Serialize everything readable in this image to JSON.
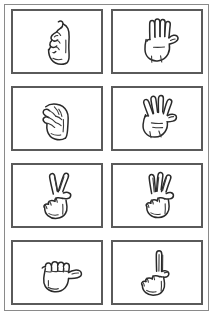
{
  "sheet": {
    "title": "ASL Fingerspelling Hand Sign Chart",
    "background_color": "#ffffff",
    "page_border_color": "#8a8a8a",
    "panel_border_color": "#5a5a5a",
    "ink_color": "#2a2a2a",
    "columns": 2,
    "rows": 4,
    "panel_count": 8
  },
  "panels": [
    {
      "index": 1,
      "row": 1,
      "column": 1,
      "icon_name": "asl-hand-sign-x-icon",
      "caption": "",
      "description": "Hand in profile with index finger bent into a hook, other fingers curled into the palm, thumb tucked at the side"
    },
    {
      "index": 2,
      "row": 1,
      "column": 2,
      "icon_name": "asl-hand-sign-b-icon",
      "caption": "",
      "description": "Open flat hand, four fingers extended upward and held together, thumb folded across the palm"
    },
    {
      "index": 3,
      "row": 2,
      "column": 1,
      "icon_name": "asl-hand-sign-e-icon",
      "caption": "",
      "description": "Closed claw-like hand seen from the side, all fingertips curled down against the thumb"
    },
    {
      "index": 4,
      "row": 2,
      "column": 2,
      "icon_name": "asl-hand-sign-4-icon",
      "caption": "",
      "description": "Open hand with four fingers spread apart and extended, thumb resting across the palm"
    },
    {
      "index": 5,
      "row": 3,
      "column": 1,
      "icon_name": "asl-hand-sign-v-icon",
      "caption": "",
      "description": "Fist with index and middle fingers extended upward in a V shape"
    },
    {
      "index": 6,
      "row": 3,
      "column": 2,
      "icon_name": "asl-hand-sign-w-icon",
      "caption": "",
      "description": "Fist with index, middle and ring fingers extended upward, thumb holding the little finger down"
    },
    {
      "index": 7,
      "row": 4,
      "column": 1,
      "icon_name": "asl-hand-sign-a-icon",
      "caption": "",
      "description": "Closed fist viewed from the side with the thumb extended out horizontally"
    },
    {
      "index": 8,
      "row": 4,
      "column": 2,
      "icon_name": "asl-hand-sign-d-icon",
      "caption": "",
      "description": "Fist with only the index finger extended straight upward, thumb touching the curled middle finger"
    }
  ]
}
